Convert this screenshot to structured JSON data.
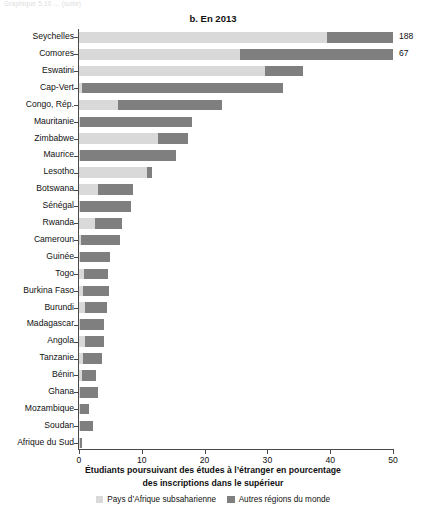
{
  "faint_header": "Graphique 5.10 ... (suite)",
  "title": "b. En 2013",
  "axis_caption_line1": "Étudiants poursuivant des études à l’étranger en pourcentage",
  "axis_caption_line2": "des inscriptions dans le supérieur",
  "legend": [
    {
      "label": "Pays d’Afrique subsaharienne",
      "color": "#d9d9d9",
      "name": "legend-ssa"
    },
    {
      "label": "Autres régions du monde",
      "color": "#7f7f7f",
      "name": "legend-other"
    }
  ],
  "colors": {
    "light": "#d9d9d9",
    "dark": "#7f7f7f",
    "axis": "#4a4a4a"
  },
  "chart_data": {
    "type": "bar",
    "orientation": "horizontal",
    "stacked": true,
    "title": "b. En 2013",
    "xlabel": "Étudiants poursuivant des études à l’étranger en pourcentage des inscriptions dans le supérieur",
    "ylabel": "",
    "xlim": [
      0,
      50
    ],
    "xticks": [
      0,
      10,
      20,
      30,
      40,
      50
    ],
    "xtick_labels": [
      "0",
      "10",
      "20",
      "30",
      "40",
      "50"
    ],
    "grid": false,
    "legend_position": "bottom",
    "series": [
      {
        "name": "Pays d’Afrique subsaharienne",
        "color": "#d9d9d9"
      },
      {
        "name": "Autres régions du monde",
        "color": "#7f7f7f"
      }
    ],
    "categories": [
      "Seychelles",
      "Comores",
      "Eswatini",
      "Cap-Vert",
      "Congo, Rép.",
      "Mauritanie",
      "Zimbabwe",
      "Maurice",
      "Lesotho",
      "Botswana",
      "Sénégal",
      "Rwanda",
      "Cameroun",
      "Guinée",
      "Togo",
      "Burkina Faso",
      "Burundi",
      "Madagascar",
      "Angola",
      "Tanzanie",
      "Bénin",
      "Ghana",
      "Mozambique",
      "Soudan",
      "Afrique du Sud"
    ],
    "bars": [
      {
        "category": "Speychelles_placeholder",
        "ssa": 0,
        "other": 0,
        "total": 0,
        "value_label": "",
        "truncated": false
      }
    ],
    "rows": [
      {
        "category": "Seychelles",
        "ssa": 39.5,
        "other": 10.5,
        "total": 188,
        "value_label": "188",
        "truncated": true
      },
      {
        "category": "Comores",
        "ssa": 25.6,
        "other": 24.4,
        "total": 67,
        "value_label": "67",
        "truncated": true
      },
      {
        "category": "Eswatini",
        "ssa": 29.6,
        "other": 6.1,
        "total": 35.7,
        "value_label": "",
        "truncated": false
      },
      {
        "category": "Cap-Vert",
        "ssa": 0.5,
        "other": 32.0,
        "total": 32.5,
        "value_label": "",
        "truncated": false
      },
      {
        "category": "Congo, Rép.",
        "ssa": 6.2,
        "other": 16.6,
        "total": 22.8,
        "value_label": "",
        "truncated": false
      },
      {
        "category": "Mauritanie",
        "ssa": 0.2,
        "other": 17.8,
        "total": 18.0,
        "value_label": "",
        "truncated": false
      },
      {
        "category": "Zimbabwe",
        "ssa": 12.6,
        "other": 4.8,
        "total": 17.4,
        "value_label": "",
        "truncated": false
      },
      {
        "category": "Maurice",
        "ssa": 0.2,
        "other": 15.2,
        "total": 15.4,
        "value_label": "",
        "truncated": false
      },
      {
        "category": "Lesotho",
        "ssa": 10.8,
        "other": 0.8,
        "total": 11.6,
        "value_label": "",
        "truncated": false
      },
      {
        "category": "Botswana",
        "ssa": 3.0,
        "other": 5.6,
        "total": 8.6,
        "value_label": "",
        "truncated": false
      },
      {
        "category": "Sénégal",
        "ssa": 0.2,
        "other": 8.1,
        "total": 8.3,
        "value_label": "",
        "truncated": false
      },
      {
        "category": "Rwanda",
        "ssa": 2.6,
        "other": 4.2,
        "total": 6.8,
        "value_label": "",
        "truncated": false
      },
      {
        "category": "Cameroun",
        "ssa": 0.3,
        "other": 6.2,
        "total": 6.5,
        "value_label": "",
        "truncated": false
      },
      {
        "category": "Guinée",
        "ssa": 0.2,
        "other": 4.7,
        "total": 4.9,
        "value_label": "",
        "truncated": false
      },
      {
        "category": "Togo",
        "ssa": 0.8,
        "other": 3.8,
        "total": 4.6,
        "value_label": "",
        "truncated": false
      },
      {
        "category": "Burkina Faso",
        "ssa": 0.7,
        "other": 4.1,
        "total": 4.8,
        "value_label": "",
        "truncated": false
      },
      {
        "category": "Burundi",
        "ssa": 1.0,
        "other": 3.5,
        "total": 4.5,
        "value_label": "",
        "truncated": false
      },
      {
        "category": "Madagascar",
        "ssa": 0.2,
        "other": 3.8,
        "total": 4.0,
        "value_label": "",
        "truncated": false
      },
      {
        "category": "Angola",
        "ssa": 0.9,
        "other": 3.1,
        "total": 4.0,
        "value_label": "",
        "truncated": false
      },
      {
        "category": "Tanzanie",
        "ssa": 0.6,
        "other": 3.0,
        "total": 3.6,
        "value_label": "",
        "truncated": false
      },
      {
        "category": "Bénin",
        "ssa": 0.5,
        "other": 2.2,
        "total": 2.7,
        "value_label": "",
        "truncated": false
      },
      {
        "category": "Ghana",
        "ssa": 0.2,
        "other": 2.8,
        "total": 3.0,
        "value_label": "",
        "truncated": false
      },
      {
        "category": "Mozambique",
        "ssa": 0.2,
        "other": 1.4,
        "total": 1.6,
        "value_label": "",
        "truncated": false
      },
      {
        "category": "Soudan",
        "ssa": 0.1,
        "other": 2.2,
        "total": 2.3,
        "value_label": "",
        "truncated": false
      },
      {
        "category": "Afrique du Sud",
        "ssa": 0.1,
        "other": 0.4,
        "total": 0.5,
        "value_label": "",
        "truncated": false
      }
    ]
  }
}
